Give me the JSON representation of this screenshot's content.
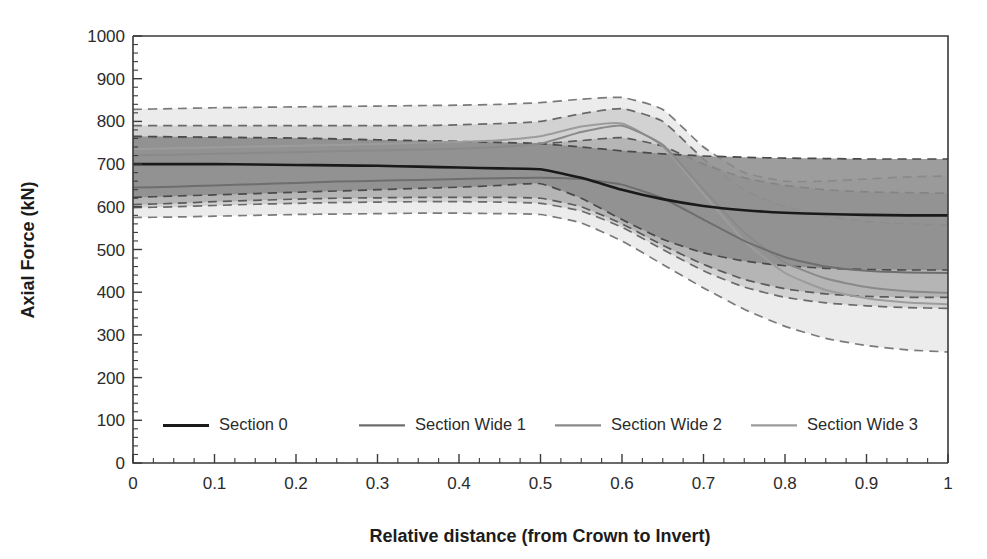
{
  "chart_data": {
    "type": "line",
    "title": "",
    "xlabel": "Relative distance (from Crown to Invert)",
    "ylabel": "Axial Force (kN)",
    "xlim": [
      0,
      1
    ],
    "ylim": [
      0,
      1000
    ],
    "xticks": [
      0,
      0.1,
      0.2,
      0.3,
      0.4,
      0.5,
      0.6,
      0.7,
      0.8,
      0.9,
      1
    ],
    "xtick_labels": [
      "0",
      "0.1",
      "0.2",
      "0.3",
      "0.4",
      "0.5",
      "0.6",
      "0.7",
      "0.8",
      "0.9",
      "1"
    ],
    "yticks": [
      0,
      100,
      200,
      300,
      400,
      500,
      600,
      700,
      800,
      900,
      1000
    ],
    "ytick_labels": [
      "0",
      "100",
      "200",
      "300",
      "400",
      "500",
      "600",
      "700",
      "800",
      "900",
      "1000"
    ],
    "y_minor_tick_step": 20,
    "x_minor_tick_step": 0.025,
    "grid": false,
    "legend_position": "bottom-inside",
    "band_style": "dashed-edges-with-shaded-fill",
    "x": [
      0,
      0.05,
      0.1,
      0.15,
      0.2,
      0.25,
      0.3,
      0.35,
      0.4,
      0.45,
      0.5,
      0.55,
      0.6,
      0.65,
      0.7,
      0.75,
      0.8,
      0.85,
      0.9,
      0.95,
      1
    ],
    "series": [
      {
        "name": "Section 0",
        "color": "#1a1a1a",
        "line_width": 2.6,
        "values": [
          700,
          700,
          700,
          699,
          698,
          697,
          696,
          694,
          692,
          690,
          688,
          668,
          640,
          618,
          602,
          592,
          586,
          583,
          581,
          580,
          580
        ],
        "band_upper": [
          765,
          764,
          763,
          762,
          761,
          759,
          757,
          755,
          753,
          751,
          748,
          740,
          731,
          724,
          719,
          716,
          714,
          713,
          712,
          712,
          712
        ],
        "band_lower": [
          622,
          625,
          628,
          631,
          634,
          637,
          640,
          643,
          646,
          650,
          654,
          620,
          570,
          524,
          492,
          473,
          462,
          456,
          453,
          452,
          452
        ],
        "band_fill": "#8c8c8c",
        "band_alpha": 0.85,
        "band_edge_color": "#4a4a4a"
      },
      {
        "name": "Section Wide 1",
        "color": "#6e6e6e",
        "line_width": 2.0,
        "values": [
          645,
          647,
          650,
          653,
          656,
          659,
          661,
          663,
          665,
          667,
          668,
          665,
          652,
          620,
          570,
          520,
          482,
          460,
          450,
          446,
          445
        ],
        "band_upper": [
          762,
          762,
          762,
          761,
          760,
          758,
          756,
          754,
          752,
          750,
          748,
          755,
          762,
          742,
          700,
          668,
          650,
          640,
          635,
          633,
          632
        ],
        "band_lower": [
          605,
          608,
          612,
          615,
          618,
          620,
          621,
          622,
          622,
          622,
          620,
          600,
          560,
          510,
          465,
          430,
          408,
          396,
          390,
          388,
          388
        ],
        "band_fill": "#a8a8a8",
        "band_alpha": 0.7,
        "band_edge_color": "#5a5a5a"
      },
      {
        "name": "Section Wide 2",
        "color": "#8a8a8a",
        "line_width": 2.0,
        "values": [
          720,
          722,
          724,
          726,
          728,
          730,
          732,
          734,
          736,
          740,
          748,
          775,
          790,
          745,
          640,
          540,
          470,
          432,
          412,
          402,
          398
        ],
        "band_upper": [
          790,
          790,
          790,
          790,
          790,
          790,
          790,
          790,
          792,
          795,
          800,
          818,
          830,
          800,
          712,
          640,
          600,
          578,
          566,
          560,
          558
        ],
        "band_lower": [
          598,
          600,
          603,
          606,
          608,
          610,
          611,
          612,
          612,
          611,
          608,
          590,
          552,
          500,
          450,
          412,
          388,
          375,
          368,
          364,
          362
        ],
        "band_fill": "#c2c2c2",
        "band_alpha": 0.6,
        "band_edge_color": "#6a6a6a"
      },
      {
        "name": "Section Wide 3",
        "color": "#9c9c9c",
        "line_width": 2.0,
        "values": [
          735,
          737,
          739,
          741,
          743,
          745,
          747,
          750,
          752,
          756,
          765,
          788,
          795,
          742,
          630,
          520,
          445,
          405,
          386,
          376,
          372
        ],
        "band_upper": [
          828,
          830,
          832,
          833,
          834,
          835,
          836,
          837,
          838,
          840,
          844,
          852,
          856,
          828,
          740,
          680,
          660,
          660,
          665,
          670,
          672
        ],
        "band_lower": [
          575,
          576,
          578,
          580,
          582,
          583,
          584,
          585,
          585,
          584,
          582,
          562,
          520,
          465,
          410,
          360,
          320,
          292,
          275,
          265,
          260
        ],
        "band_fill": "#dcdcdc",
        "band_alpha": 0.55,
        "band_edge_color": "#7a7a7a"
      }
    ],
    "annotations": []
  },
  "legend": {
    "entries": [
      {
        "label": "Section 0",
        "color": "#1a1a1a",
        "width": 3.0
      },
      {
        "label": "Section Wide 1",
        "color": "#6e6e6e",
        "width": 2.2
      },
      {
        "label": "Section Wide 2",
        "color": "#8a8a8a",
        "width": 2.2
      },
      {
        "label": "Section Wide 3",
        "color": "#9c9c9c",
        "width": 2.2
      }
    ]
  },
  "axes": {
    "x_title": "Relative distance (from Crown to Invert)",
    "y_title": "Axial Force (kN)"
  },
  "colors": {
    "axis": "#3a3a3a",
    "text": "#2b2b2b",
    "background": "#ffffff"
  }
}
